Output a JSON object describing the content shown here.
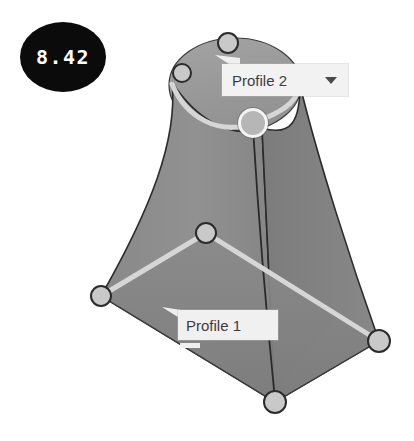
{
  "viewport": {
    "background_color": "#ffffff",
    "width": 414,
    "height": 441
  },
  "dimension_badge": {
    "value": "8.42",
    "background_color": "#0b0b0b",
    "text_color": "#ffffff",
    "shape": "ellipse"
  },
  "callouts": [
    {
      "id": "profile-2",
      "label": "Profile 2",
      "has_dropdown": true,
      "dropdown_icon": "chevron-down-icon",
      "background_color": "#f2f2f2",
      "text_color": "#3d3d3d"
    },
    {
      "id": "profile-1",
      "label": "Profile 1",
      "has_dropdown": false,
      "background_color": "#f0f0f0",
      "text_color": "#3d3d3d"
    }
  ],
  "model": {
    "type": "loft-surface",
    "fill_color_front": "#8f8f8f",
    "fill_color_side": "#7e7e7e",
    "fill_color_cap": "#9b9b9b",
    "edge_color": "#2e2e2e",
    "profile_curve_color": "#d2d2d2",
    "handle_fill": "#c9c9c9",
    "handle_stroke": "#2b2b2b",
    "handle_active_ring": "#f4f4f4"
  },
  "handles": [
    {
      "name": "handle-top-apex",
      "x": 228,
      "y": 43,
      "r": 11,
      "active": false
    },
    {
      "name": "handle-top-left",
      "x": 182,
      "y": 73,
      "r": 10,
      "active": false
    },
    {
      "name": "handle-profile2-center",
      "x": 253,
      "y": 123,
      "r": 15,
      "active": true
    },
    {
      "name": "handle-profile1-center",
      "x": 206,
      "y": 233,
      "r": 11,
      "active": false
    },
    {
      "name": "handle-base-left",
      "x": 101,
      "y": 296,
      "r": 11,
      "active": false
    },
    {
      "name": "handle-base-right",
      "x": 379,
      "y": 341,
      "r": 12,
      "active": false
    },
    {
      "name": "handle-base-bottom",
      "x": 275,
      "y": 402,
      "r": 12,
      "active": false
    }
  ]
}
